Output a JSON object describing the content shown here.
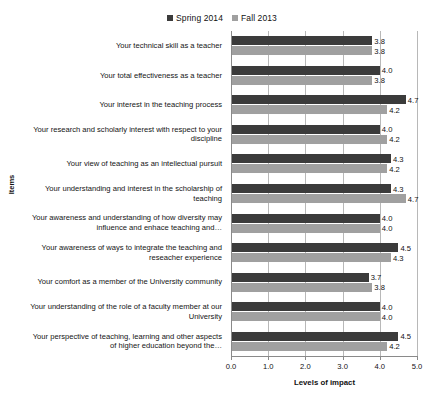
{
  "chart_data": {
    "type": "bar",
    "orientation": "horizontal",
    "title": "",
    "xlabel": "Levels of impact",
    "ylabel": "Items",
    "xlim": [
      0.0,
      5.0
    ],
    "xticks": [
      "0.0",
      "1.0",
      "2.0",
      "3.0",
      "4.0",
      "5.0"
    ],
    "grid": true,
    "legend_position": "top-center",
    "categories": [
      "Your technical skill as a teacher",
      "Your total effectiveness as a teacher",
      "Your interest in the teaching process",
      "Your research and scholarly interest with respect to your discipline",
      "Your view of teaching as an intellectual pursuit",
      "Your understanding and interest in the scholarship of teaching",
      "Your awareness and understanding of how diversity may influence and enhace teaching and…",
      "Your awareness of ways to integrate the teaching and reseacher experience",
      "Your comfort as a member of the University community",
      "Your understanding of the role of a faculty member at our University",
      "Your perspective of teaching, learning and other aspects of higher education beyond the…"
    ],
    "series": [
      {
        "name": "Spring 2014",
        "color": "#3b3b3b",
        "values": [
          3.8,
          4.0,
          4.7,
          4.0,
          4.3,
          4.3,
          4.0,
          4.5,
          3.7,
          4.0,
          4.5
        ],
        "labels": [
          "3.8",
          "4.0",
          "4.7",
          "4.0",
          "4.3",
          "4.3",
          "4.0",
          "4.5",
          "3.7",
          "4.0",
          "4.5"
        ]
      },
      {
        "name": "Fall 2013",
        "color": "#a0a0a0",
        "values": [
          3.8,
          3.8,
          4.2,
          4.2,
          4.2,
          4.7,
          4.0,
          4.3,
          3.8,
          4.0,
          4.2
        ],
        "labels": [
          "3.8",
          "3.8",
          "4.2",
          "4.2",
          "4.2",
          "4.7",
          "4.0",
          "4.3",
          "3.8",
          "4.0",
          "4.2"
        ]
      }
    ]
  }
}
